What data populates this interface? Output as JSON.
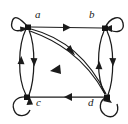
{
  "figure": {
    "kind": "directed-graph-diagram",
    "width": 128,
    "height": 124,
    "background_color": "#ffffff",
    "stroke_color": "#1b1b1b",
    "node_color": "#141414",
    "label_color": "#1a1a1a"
  },
  "nodes": [
    {
      "id": "a",
      "label": "a",
      "x": 28,
      "y": 27,
      "label_x": 35,
      "label_y": 13,
      "self_loop": "up-left"
    },
    {
      "id": "b",
      "label": "b",
      "x": 105,
      "y": 28,
      "label_x": 89,
      "label_y": 13,
      "self_loop": "up-right"
    },
    {
      "id": "c",
      "label": "c",
      "x": 27,
      "y": 97,
      "label_x": 35,
      "label_y": 99,
      "self_loop": "down-left"
    },
    {
      "id": "d",
      "label": "d",
      "x": 107,
      "y": 97,
      "label_x": 88,
      "label_y": 99,
      "self_loop": "down-right"
    }
  ],
  "edges": [
    {
      "from": "a",
      "to": "b",
      "shape": "straight",
      "note": "top horizontal, arrow at midpoint pointing right"
    },
    {
      "from": "d",
      "to": "c",
      "shape": "straight",
      "note": "bottom horizontal, arrow at midpoint pointing left"
    },
    {
      "from": "c",
      "to": "a",
      "shape": "curve-left",
      "note": "left side outer curve, arrow pointing up"
    },
    {
      "from": "a",
      "to": "c",
      "shape": "curve-right",
      "note": "left side inner curve, arrow pointing down"
    },
    {
      "from": "d",
      "to": "b",
      "shape": "curve-left",
      "note": "right side inner curve, arrow pointing up"
    },
    {
      "from": "b",
      "to": "d",
      "shape": "curve-right",
      "note": "right side outer curve, arrow pointing down"
    },
    {
      "from": "a",
      "to": "d",
      "shape": "curve-upper",
      "note": "diagonal upper curve, arrow pointing down-right"
    },
    {
      "from": "d",
      "to": "a",
      "shape": "curve-lower",
      "note": "diagonal lower curve, arrow pointing down-left"
    }
  ],
  "self_loops": [
    {
      "at": "a",
      "direction": "up-left",
      "arrow": "into node from lower-left"
    },
    {
      "at": "b",
      "direction": "up-right",
      "arrow": "into node from left"
    },
    {
      "at": "c",
      "direction": "down-left",
      "arrow": "into node from right"
    },
    {
      "at": "d",
      "direction": "down-right",
      "arrow": "into node from upper-left"
    }
  ]
}
